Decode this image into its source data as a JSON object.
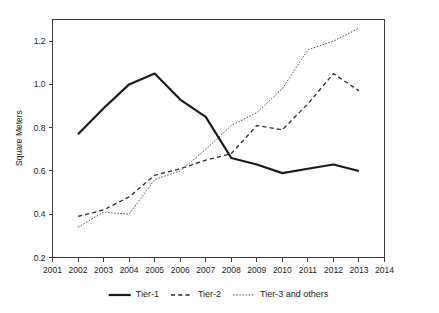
{
  "chart_data": {
    "type": "line",
    "title": "",
    "xlabel": "",
    "ylabel": "Square Meters",
    "x": [
      2002,
      2003,
      2004,
      2005,
      2006,
      2007,
      2008,
      2009,
      2010,
      2011,
      2012,
      2013
    ],
    "xlim": [
      2001,
      2014
    ],
    "ylim": [
      0.2,
      1.3
    ],
    "xticks": [
      "2001",
      "2002",
      "2003",
      "2004",
      "2005",
      "2006",
      "2007",
      "2008",
      "2009",
      "2010",
      "2011",
      "2012",
      "2013",
      "2014"
    ],
    "xtick_values": [
      2001,
      2002,
      2003,
      2004,
      2005,
      2006,
      2007,
      2008,
      2009,
      2010,
      2011,
      2012,
      2013,
      2014
    ],
    "yticks": [
      "0.2",
      "0.4",
      "0.6",
      "0.8",
      "1.0",
      "1.2"
    ],
    "ytick_values": [
      0.2,
      0.4,
      0.6,
      0.8,
      1.0,
      1.2
    ],
    "grid": false,
    "legend_position": "bottom",
    "series": [
      {
        "name": "Tier-1",
        "style": "solid",
        "color": "#1a1a1a",
        "width": 2.2,
        "values": [
          0.77,
          0.89,
          1.0,
          1.05,
          0.93,
          0.85,
          0.66,
          0.63,
          0.59,
          0.61,
          0.63,
          0.6
        ]
      },
      {
        "name": "Tier-2",
        "style": "dashed",
        "color": "#2b2b2b",
        "width": 1.3,
        "values": [
          0.39,
          0.42,
          0.48,
          0.58,
          0.61,
          0.65,
          0.68,
          0.81,
          0.79,
          0.91,
          1.05,
          0.97
        ]
      },
      {
        "name": "Tier-3 and others",
        "style": "dotted",
        "color": "#555555",
        "width": 1.0,
        "values": [
          0.34,
          0.41,
          0.4,
          0.56,
          0.6,
          0.7,
          0.81,
          0.87,
          0.98,
          1.16,
          1.2,
          1.26
        ]
      }
    ]
  },
  "legend": {
    "items": [
      {
        "label": "Tier-1"
      },
      {
        "label": "Tier-2"
      },
      {
        "label": "Tier-3 and others"
      }
    ]
  }
}
